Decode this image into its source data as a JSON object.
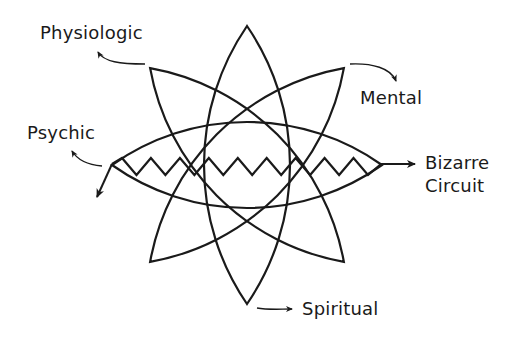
{
  "diagram": {
    "labels": {
      "physiologic": "Physiologic",
      "mental": "Mental",
      "psychic": "Psychic",
      "bizarre_line1": "Bizarre",
      "bizarre_line2": "Circuit",
      "spiritual": "Spiritual"
    },
    "colors": {
      "stroke": "#1a1a1a",
      "background": "#ffffff"
    },
    "petals": [
      {
        "name": "vertical-petal",
        "angle_deg": 90
      },
      {
        "name": "horizontal-petal",
        "angle_deg": 0
      },
      {
        "name": "diagonal-petal-ul-lr",
        "angle_deg": 45
      },
      {
        "name": "diagonal-petal-ur-ll",
        "angle_deg": -45
      }
    ],
    "zigzag_teeth": 9
  }
}
